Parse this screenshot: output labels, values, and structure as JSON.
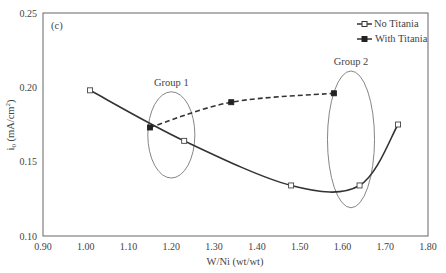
{
  "chart_data": {
    "type": "line",
    "panel_label": "(c)",
    "title": "",
    "xlabel": "W/Ni (wt/wt)",
    "ylabel": "i0 (mA/cm2)",
    "ylabel_main": "i",
    "ylabel_sub": "0",
    "ylabel_rest": " (mA/cm",
    "ylabel_sup": "2",
    "ylabel_close": ")",
    "xlim": [
      0.9,
      1.8
    ],
    "ylim": [
      0.1,
      0.25
    ],
    "xticks": [
      "0.90",
      "1.00",
      "1.10",
      "1.20",
      "1.30",
      "1.40",
      "1.50",
      "1.60",
      "1.70",
      "1.80"
    ],
    "yticks": [
      "0.10",
      "0.15",
      "0.20",
      "0.25"
    ],
    "grid": false,
    "legend_position": "top-right",
    "series": [
      {
        "name": "No Titania",
        "marker": "open-square",
        "line": "solid",
        "color": "#333333",
        "x": [
          1.01,
          1.23,
          1.48,
          1.64,
          1.73
        ],
        "y": [
          0.198,
          0.164,
          0.134,
          0.134,
          0.175
        ]
      },
      {
        "name": "With Titania",
        "marker": "filled-square",
        "line": "dashed",
        "color": "#333333",
        "x": [
          1.15,
          1.34,
          1.58
        ],
        "y": [
          0.173,
          0.19,
          0.196
        ]
      }
    ],
    "annotations": [
      {
        "text": "Group 1",
        "shape": "ellipse",
        "cx": 1.2,
        "cy": 0.168,
        "rx": 0.055,
        "ry": 0.029
      },
      {
        "text": "Group 2",
        "shape": "ellipse",
        "cx": 1.62,
        "cy": 0.165,
        "rx": 0.055,
        "ry": 0.046
      }
    ]
  }
}
